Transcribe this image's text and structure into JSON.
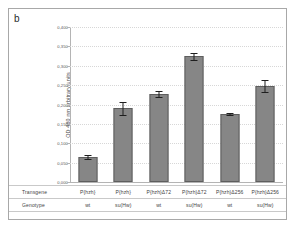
{
  "figure": {
    "panel_label": "b",
    "bar_color": "#868686",
    "bar_edge_color": "#5e5e5e",
    "error_bar_color": "#1e1e1e",
    "frame_color": "#a8a8a8",
    "grid_color": "#d7d7d7"
  },
  "chart_data": {
    "type": "bar",
    "title": "",
    "xlabel": "",
    "ylabel": "OD 480 nm arbitrary units",
    "ylim": [
      0.0,
      0.4
    ],
    "ytick_labels": [
      "0,400",
      "0,350",
      "0,300",
      "0,250",
      "0,200",
      "0,150",
      "0,100",
      "0,050",
      "0,000"
    ],
    "ytick_values": [
      0.4,
      0.35,
      0.3,
      0.25,
      0.2,
      0.15,
      0.1,
      0.05,
      0.0
    ],
    "grid": true,
    "legend": false,
    "categories": [
      "P{hzh} wt",
      "P{hzh} su(Hw)",
      "P{hzh}Δ72 wt",
      "P{hzh}Δ72 su(Hw)",
      "P{hzh}Δ256 wt",
      "P{hzh}Δ256 su(Hw)"
    ],
    "values": [
      0.065,
      0.19,
      0.228,
      0.325,
      0.175,
      0.248
    ],
    "errors": [
      0.005,
      0.016,
      0.008,
      0.009,
      0.003,
      0.015
    ]
  },
  "label_table": {
    "rows": [
      {
        "header": "Transgene",
        "cells": [
          "P{hzh}",
          "P{hzh}",
          "P{hzh}Δ72",
          "P{hzh}Δ72",
          "P{hzh}Δ256",
          "P{hzh}Δ256"
        ]
      },
      {
        "header": "Genotype",
        "cells": [
          "wt",
          "su(Hw)",
          "wt",
          "su(Hw)",
          "wt",
          "su(Hw)"
        ]
      }
    ]
  }
}
